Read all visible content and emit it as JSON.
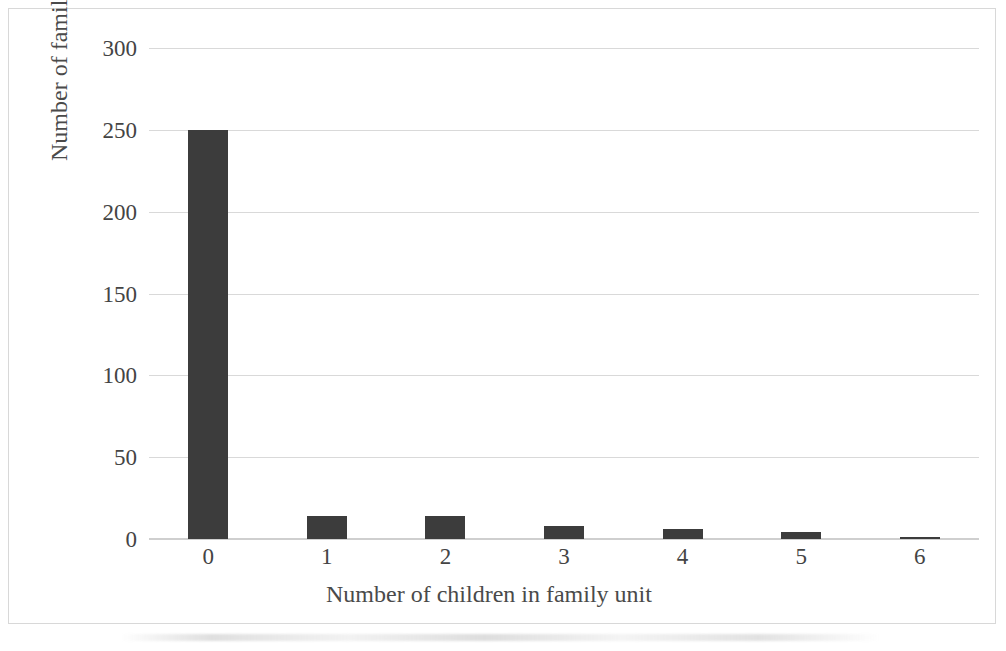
{
  "chart_data": {
    "type": "bar",
    "title": "",
    "xlabel": "Number of children in family unit",
    "ylabel": "Number of families",
    "categories": [
      "0",
      "1",
      "2",
      "3",
      "4",
      "5",
      "6"
    ],
    "values": [
      250,
      14,
      14,
      8,
      6,
      4,
      1
    ],
    "ylim": [
      0,
      300
    ],
    "yticks": [
      0,
      50,
      100,
      150,
      200,
      250,
      300
    ],
    "ytick_labels": [
      "0",
      "50",
      "100",
      "150",
      "200",
      "250",
      "300"
    ],
    "grid": true,
    "grid_axis": "y",
    "legend": false,
    "legend_position": "none",
    "series": [
      {
        "name": "Number of families",
        "values": [
          250,
          14,
          14,
          8,
          6,
          4,
          1
        ]
      }
    ]
  },
  "style": {
    "bar_color": "#3c3c3c",
    "gridline_color": "#d9d9d9",
    "axis_color": "#cfcfcf",
    "text_color": "#444444",
    "background_color": "#ffffff",
    "border_color": "#d8d8d8"
  }
}
